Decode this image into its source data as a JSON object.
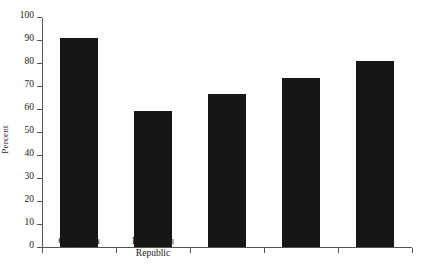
{
  "chart_data": {
    "type": "bar",
    "title": "",
    "xlabel": "",
    "ylabel": "Percent",
    "categories": [
      "Costa Rica",
      "Dominican Republic",
      "Haiti",
      "Mexico",
      "Nicaragua"
    ],
    "values": [
      91,
      59,
      66.5,
      73.5,
      81
    ],
    "ylim": [
      0,
      100
    ],
    "ytick_labels": [
      "0",
      "10",
      "20",
      "30",
      "40",
      "50",
      "60",
      "70",
      "80",
      "90",
      "100"
    ],
    "ytick_values": [
      0,
      10,
      20,
      30,
      40,
      50,
      60,
      70,
      80,
      90,
      100
    ],
    "grid": false,
    "legend": null,
    "bar_color": "#161616",
    "axis_color": "#555555",
    "text_color": "#1a1a1a"
  }
}
